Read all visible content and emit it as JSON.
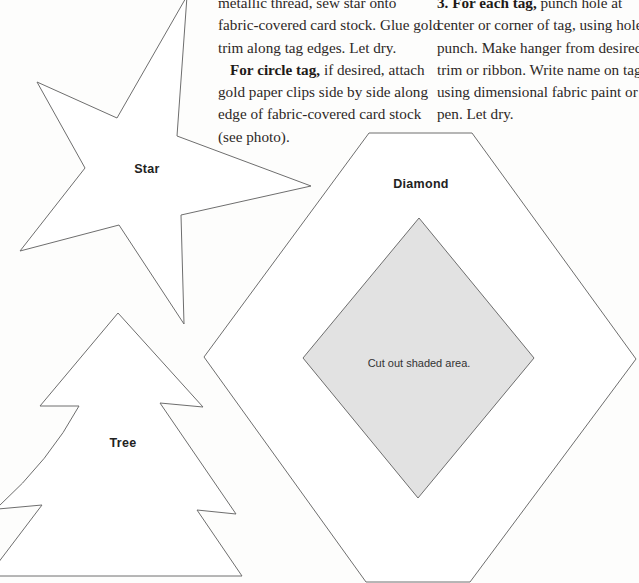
{
  "column_left": {
    "paragraph_1_lines": [
      "metallic thread, sew star onto",
      "fabric-covered card stock. Glue gold",
      "trim along tag edges. Let dry."
    ],
    "paragraph_2": {
      "lead": "For circle tag,",
      "first_line_rest": " if desired, attach",
      "lines": [
        "gold paper clips side by side along",
        "edge of fabric-covered card stock",
        "(see photo)."
      ]
    }
  },
  "column_right": {
    "step_number": "3.",
    "lead": "For each tag,",
    "first_line_rest": " punch hole at",
    "lines": [
      "center or corner of tag, using hole",
      "punch. Make hanger from desired",
      "trim or ribbon. Write name on tag,",
      "using dimensional fabric paint or",
      "pen. Let dry."
    ]
  },
  "patterns": {
    "star": {
      "label": "Star"
    },
    "tree": {
      "label": "Tree"
    },
    "diamond": {
      "label": "Diamond",
      "cutout_note": "Cut out shaded area."
    }
  },
  "colors": {
    "outline": "#6e6e6e",
    "cutout_fill": "#e2e2e2",
    "background": "#fdfdfc"
  }
}
